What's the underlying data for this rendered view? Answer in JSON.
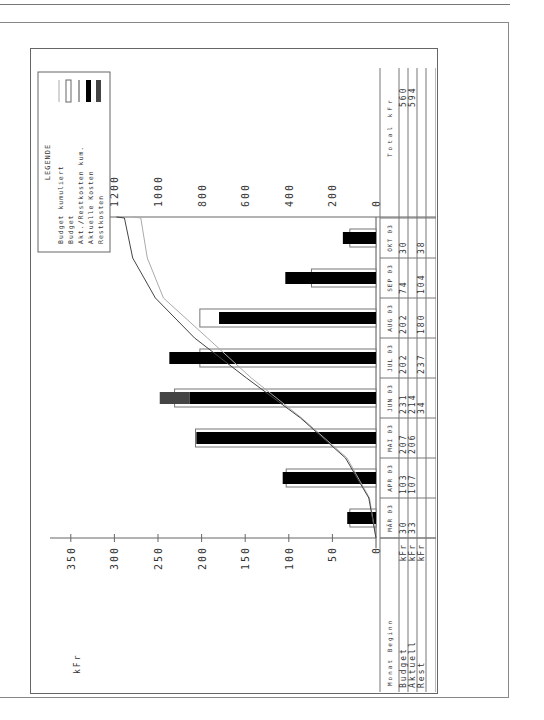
{
  "chart_data": {
    "type": "bar",
    "title": "",
    "legend_title": "LEGENDE",
    "legend": [
      {
        "label": "Budget kumuliert",
        "style": "thin-grey-line"
      },
      {
        "label": "Budget",
        "style": "outlined-bar"
      },
      {
        "label": "Akt./Restkosten kum.",
        "style": "thin-dark-line"
      },
      {
        "label": "Aktuelle Kosten",
        "style": "black-bar"
      },
      {
        "label": "Restkosten",
        "style": "grey-bar"
      }
    ],
    "ylabel_left": "kFr",
    "ylabel_right": "kFr",
    "ylim_left": [
      0,
      350
    ],
    "yticks_left": [
      0,
      50,
      100,
      150,
      200,
      250,
      300,
      350
    ],
    "ylim_right": [
      0,
      1400
    ],
    "yticks_right": [
      0,
      200,
      400,
      600,
      800,
      1000,
      1200,
      1400
    ],
    "categories": [
      "MÄR 03",
      "APR 03",
      "MAI 03",
      "JUN 03",
      "JUL 03",
      "AUG 03",
      "SEP 03",
      "OKT 03"
    ],
    "series": [
      {
        "name": "Budget",
        "unit": "kFr",
        "values": [
          30,
          103,
          207,
          231,
          202,
          202,
          74,
          30
        ]
      },
      {
        "name": "Aktuell",
        "unit": "kFr",
        "values": [
          33,
          107,
          206,
          214,
          null,
          null,
          null,
          null
        ]
      },
      {
        "name": "Rest",
        "unit": "kFr",
        "values": [
          null,
          null,
          null,
          34,
          237,
          180,
          104,
          38
        ]
      },
      {
        "name": "Budget kum",
        "unit": "kFr",
        "values": [
          30,
          133,
          341,
          572,
          773,
          975,
          1049,
          1079
        ]
      },
      {
        "name": "Akt./R. kum",
        "unit": "kFr",
        "values": [
          33,
          140,
          346,
          594,
          832,
          1012,
          1116,
          1154
        ]
      }
    ],
    "totals": {
      "header": "Total kFr",
      "budget": 560,
      "aktuell": 594,
      "budget_kum": 1079,
      "akt_r_kum": 1154
    }
  },
  "table": {
    "header_label": "Monat Beginn",
    "total_header": "Total kFr",
    "rows": [
      {
        "label": "Budget",
        "unit": "kFr",
        "total": "560"
      },
      {
        "label": "Aktuell",
        "unit": "kFr",
        "total": "594"
      },
      {
        "label": "Rest",
        "unit": "kFr",
        "total": ""
      },
      {
        "label": "",
        "unit": "",
        "total": ""
      },
      {
        "label": "Budget",
        "unit": "kum",
        "total": "1079"
      },
      {
        "label": "Akt./R.",
        "unit": "kum",
        "total": "1154"
      }
    ],
    "cells": [
      [
        "30",
        "103",
        "207",
        "231",
        "202",
        "202",
        "74",
        "30"
      ],
      [
        "33",
        "107",
        "206",
        "214",
        "",
        "",
        "",
        ""
      ],
      [
        "",
        "",
        "",
        "34",
        "237",
        "180",
        "104",
        "38"
      ],
      [
        "",
        "",
        "",
        "",
        "",
        "",
        "",
        ""
      ],
      [
        "30",
        "133",
        "341",
        "572",
        "773",
        "975",
        "1049",
        "1079"
      ],
      [
        "33",
        "140",
        "346",
        "594",
        "832",
        "1012",
        "1116",
        "1154"
      ]
    ]
  }
}
